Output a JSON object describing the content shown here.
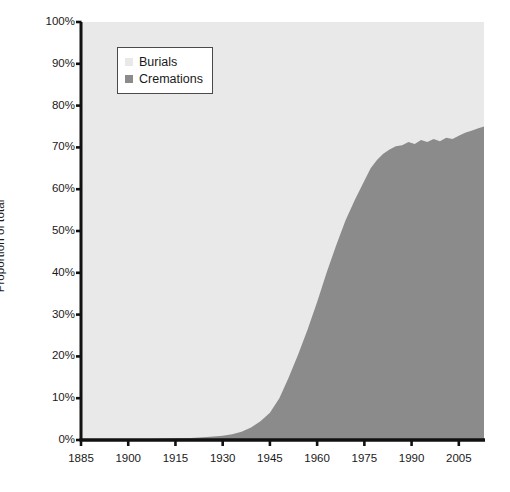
{
  "chart_data": {
    "type": "area",
    "stacked": true,
    "normalized": true,
    "title": "",
    "xlabel": "",
    "ylabel": "Proportion of total",
    "xlim": [
      1885,
      2013
    ],
    "ylim": [
      0,
      100
    ],
    "grid": false,
    "legend_position": "top-left-inside",
    "y_tick_labels": [
      "100%",
      "90%",
      "80%",
      "70%",
      "60%",
      "50%",
      "40%",
      "30%",
      "20%",
      "10%",
      "0%"
    ],
    "y_tick_values": [
      100,
      90,
      80,
      70,
      60,
      50,
      40,
      30,
      20,
      10,
      0
    ],
    "x_tick_labels": [
      "1885",
      "1900",
      "1915",
      "1930",
      "1945",
      "1960",
      "1975",
      "1990",
      "2005"
    ],
    "x_tick_values": [
      1885,
      1900,
      1915,
      1930,
      1945,
      1960,
      1975,
      1990,
      2005
    ],
    "colors": {
      "burials": "#e9e9e9",
      "cremations": "#8b8b8b",
      "axis": "#111111",
      "text": "#1a1a1a",
      "legend_border": "#4a4a4a",
      "background": "#ffffff"
    },
    "series": [
      {
        "name": "Burials",
        "color": "#e9e9e9",
        "note": "Remainder to 100% of the cremations series"
      },
      {
        "name": "Cremations",
        "color": "#8b8b8b",
        "x": [
          1885,
          1890,
          1895,
          1900,
          1905,
          1910,
          1915,
          1920,
          1925,
          1930,
          1933,
          1936,
          1939,
          1942,
          1945,
          1948,
          1951,
          1954,
          1957,
          1960,
          1963,
          1966,
          1969,
          1972,
          1975,
          1977,
          1979,
          1981,
          1983,
          1985,
          1987,
          1989,
          1991,
          1993,
          1995,
          1997,
          1999,
          2001,
          2003,
          2005,
          2007,
          2009,
          2011,
          2013
        ],
        "values": [
          0.0,
          0.0,
          0.1,
          0.1,
          0.2,
          0.3,
          0.4,
          0.5,
          0.7,
          1.0,
          1.4,
          2.0,
          3.0,
          4.5,
          6.5,
          10.0,
          15.0,
          20.5,
          26.5,
          33.0,
          40.0,
          46.5,
          52.5,
          57.5,
          62.0,
          65.0,
          67.0,
          68.5,
          69.5,
          70.3,
          70.5,
          71.3,
          70.8,
          71.8,
          71.3,
          72.0,
          71.5,
          72.3,
          72.0,
          72.8,
          73.5,
          74.0,
          74.5,
          75.0
        ]
      }
    ],
    "legend": [
      {
        "label": "Burials",
        "color": "#e9e9e9",
        "swatch": "square"
      },
      {
        "label": "Cremations",
        "color": "#8b8b8b",
        "swatch": "square"
      }
    ]
  },
  "axis": {
    "y_title": "Proportion of total"
  }
}
